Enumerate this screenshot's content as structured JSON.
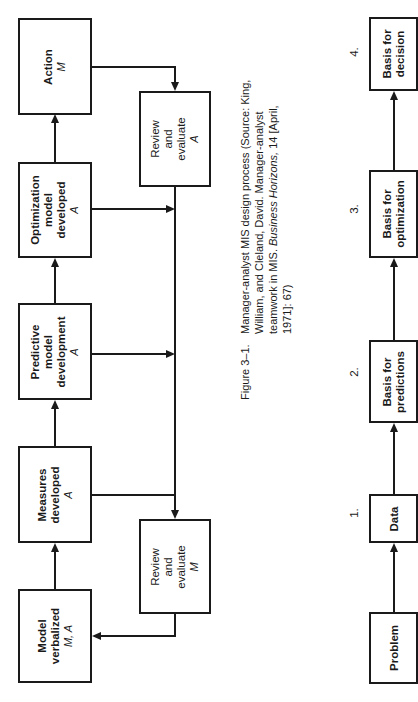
{
  "left_diagram": {
    "boxes": {
      "action": {
        "title": "Action",
        "role": "M"
      },
      "optimization": {
        "line1": "Optimization",
        "line2": "model",
        "line3": "developed",
        "role": "A"
      },
      "predictive": {
        "line1": "Predictive",
        "line2": "model",
        "line3": "development",
        "role": "A"
      },
      "measures": {
        "line1": "Measures",
        "line2": "developed",
        "role": "A"
      },
      "model_verbalized": {
        "line1": "Model",
        "line2": "verbalized",
        "role": "M, A"
      },
      "review_a": {
        "line1": "Review",
        "line2": "and",
        "line3": "evaluate",
        "role": "A"
      },
      "review_m": {
        "line1": "Review",
        "line2": "and",
        "line3": "evaluate",
        "role": "M"
      }
    }
  },
  "caption": {
    "figure_label": "Figure 3–1.",
    "text_plain": "Manager-analyst MIS design process (Source: King, William, and Cleland, David. Manager-analyst teamwork in MIS.",
    "journal": "Business Horizons,",
    "citation_end": "14 [April, 1971]: 67)"
  },
  "right_diagram": {
    "steps": [
      {
        "number": "",
        "line1": "Problem",
        "line2": ""
      },
      {
        "number": "1.",
        "line1": "Data",
        "line2": ""
      },
      {
        "number": "2.",
        "line1": "Basis for",
        "line2": "predictions"
      },
      {
        "number": "3.",
        "line1": "Basis for",
        "line2": "optimization"
      },
      {
        "number": "4.",
        "line1": "Basis for",
        "line2": "decision"
      }
    ]
  }
}
